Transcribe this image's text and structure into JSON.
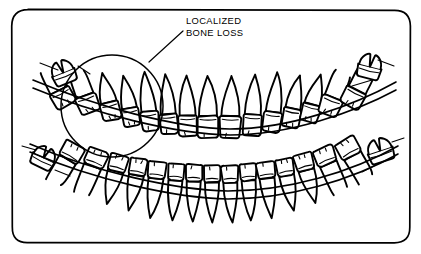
{
  "figure": {
    "background_color": "#ffffff",
    "ink_color": "#000000"
  },
  "annotation": {
    "label_line_1": "LOCALIZED",
    "label_line_2": "BONE LOSS",
    "label_x": 186,
    "label_y_line1": 24,
    "label_y_line2": 36,
    "leader_from_x": 183,
    "leader_from_y": 31,
    "leader_to_x": 149,
    "leader_to_y": 62,
    "circle_cx": 112,
    "circle_cy": 106,
    "circle_r": 51
  },
  "frame": {
    "x": 12,
    "y": 10,
    "width": 398,
    "height": 233,
    "corner_radius": 16
  },
  "chart_data": {
    "type": "diagram",
    "annotations": [
      {
        "text": "LOCALIZED BONE LOSS",
        "target": "upper-left-posterior-region",
        "marker": "circle"
      }
    ],
    "arches": [
      {
        "name": "upper-arch",
        "root_direction": "up",
        "tooth_count": 16,
        "bone_level": "receded in left posterior segment"
      },
      {
        "name": "lower-arch",
        "root_direction": "down",
        "tooth_count": 16,
        "bone_level": "normal"
      }
    ]
  },
  "upper_arch": {
    "name": "upper-arch",
    "teeth": [
      {
        "id": "u1",
        "type": "molar",
        "crown_x": 63,
        "crown_y": 98,
        "crown_w": 22,
        "crown_h": 17,
        "root_len": 24,
        "root_dir": -1,
        "tilt": -28
      },
      {
        "id": "u2",
        "type": "molar",
        "crown_x": 88,
        "crown_y": 104,
        "crown_w": 21,
        "crown_h": 18,
        "root_len": 26,
        "root_dir": -1,
        "tilt": -20
      },
      {
        "id": "u3",
        "type": "premolar",
        "crown_x": 111,
        "crown_y": 111,
        "crown_w": 19,
        "crown_h": 18,
        "root_len": 30,
        "root_dir": -1,
        "tilt": -14
      },
      {
        "id": "u4",
        "type": "premolar",
        "crown_x": 131,
        "crown_y": 117,
        "crown_w": 18,
        "crown_h": 18,
        "root_len": 33,
        "root_dir": -1,
        "tilt": -10
      },
      {
        "id": "u5",
        "type": "canine",
        "crown_x": 150,
        "crown_y": 121,
        "crown_w": 18,
        "crown_h": 19,
        "root_len": 40,
        "root_dir": -1,
        "tilt": -7
      },
      {
        "id": "u6",
        "type": "incisor",
        "crown_x": 169,
        "crown_y": 124,
        "crown_w": 18,
        "crown_h": 20,
        "root_len": 40,
        "root_dir": -1,
        "tilt": -4
      },
      {
        "id": "u7",
        "type": "incisor",
        "crown_x": 188,
        "crown_y": 126,
        "crown_w": 19,
        "crown_h": 21,
        "root_len": 40,
        "root_dir": -1,
        "tilt": -2
      },
      {
        "id": "u8",
        "type": "incisor",
        "crown_x": 208,
        "crown_y": 127,
        "crown_w": 21,
        "crown_h": 22,
        "root_len": 40,
        "root_dir": -1,
        "tilt": 0
      },
      {
        "id": "u9",
        "type": "incisor",
        "crown_x": 230,
        "crown_y": 127,
        "crown_w": 21,
        "crown_h": 22,
        "root_len": 40,
        "root_dir": -1,
        "tilt": 2
      },
      {
        "id": "u10",
        "type": "incisor",
        "crown_x": 252,
        "crown_y": 125,
        "crown_w": 19,
        "crown_h": 21,
        "root_len": 40,
        "root_dir": -1,
        "tilt": 4
      },
      {
        "id": "u11",
        "type": "canine",
        "crown_x": 272,
        "crown_y": 122,
        "crown_w": 18,
        "crown_h": 20,
        "root_len": 40,
        "root_dir": -1,
        "tilt": 7
      },
      {
        "id": "u12",
        "type": "premolar",
        "crown_x": 291,
        "crown_y": 118,
        "crown_w": 18,
        "crown_h": 19,
        "root_len": 34,
        "root_dir": -1,
        "tilt": 11
      },
      {
        "id": "u13",
        "type": "premolar",
        "crown_x": 310,
        "crown_y": 113,
        "crown_w": 19,
        "crown_h": 18,
        "root_len": 31,
        "root_dir": -1,
        "tilt": 15
      },
      {
        "id": "u14",
        "type": "molar",
        "crown_x": 330,
        "crown_y": 106,
        "crown_w": 21,
        "crown_h": 18,
        "root_len": 27,
        "root_dir": -1,
        "tilt": 21
      },
      {
        "id": "u15",
        "type": "molar",
        "crown_x": 353,
        "crown_y": 98,
        "crown_w": 22,
        "crown_h": 18,
        "root_len": 25,
        "root_dir": -1,
        "tilt": 27
      }
    ]
  },
  "lower_arch": {
    "name": "lower-arch",
    "teeth": [
      {
        "id": "l1",
        "type": "molar",
        "crown_x": 72,
        "crown_y": 152,
        "crown_w": 22,
        "crown_h": 17,
        "root_len": 28,
        "root_dir": 1,
        "tilt": 30
      },
      {
        "id": "l2",
        "type": "molar",
        "crown_x": 96,
        "crown_y": 158,
        "crown_w": 21,
        "crown_h": 17,
        "root_len": 31,
        "root_dir": 1,
        "tilt": 22
      },
      {
        "id": "l3",
        "type": "premolar",
        "crown_x": 118,
        "crown_y": 163,
        "crown_w": 19,
        "crown_h": 17,
        "root_len": 34,
        "root_dir": 1,
        "tilt": 16
      },
      {
        "id": "l4",
        "type": "premolar",
        "crown_x": 138,
        "crown_y": 167,
        "crown_w": 18,
        "crown_h": 17,
        "root_len": 36,
        "root_dir": 1,
        "tilt": 11
      },
      {
        "id": "l5",
        "type": "canine",
        "crown_x": 157,
        "crown_y": 170,
        "crown_w": 18,
        "crown_h": 17,
        "root_len": 40,
        "root_dir": 1,
        "tilt": 7
      },
      {
        "id": "l6",
        "type": "incisor",
        "crown_x": 176,
        "crown_y": 172,
        "crown_w": 17,
        "crown_h": 17,
        "root_len": 40,
        "root_dir": 1,
        "tilt": 4
      },
      {
        "id": "l7",
        "type": "incisor",
        "crown_x": 194,
        "crown_y": 173,
        "crown_w": 17,
        "crown_h": 17,
        "root_len": 40,
        "root_dir": 1,
        "tilt": 2
      },
      {
        "id": "l8",
        "type": "incisor",
        "crown_x": 212,
        "crown_y": 174,
        "crown_w": 17,
        "crown_h": 17,
        "root_len": 40,
        "root_dir": 1,
        "tilt": 0
      },
      {
        "id": "l9",
        "type": "incisor",
        "crown_x": 230,
        "crown_y": 174,
        "crown_w": 17,
        "crown_h": 17,
        "root_len": 40,
        "root_dir": 1,
        "tilt": -2
      },
      {
        "id": "l10",
        "type": "incisor",
        "crown_x": 248,
        "crown_y": 172,
        "crown_w": 17,
        "crown_h": 17,
        "root_len": 40,
        "root_dir": 1,
        "tilt": -4
      },
      {
        "id": "l11",
        "type": "canine",
        "crown_x": 266,
        "crown_y": 170,
        "crown_w": 18,
        "crown_h": 17,
        "root_len": 40,
        "root_dir": 1,
        "tilt": -7
      },
      {
        "id": "l12",
        "type": "premolar",
        "crown_x": 285,
        "crown_y": 167,
        "crown_w": 18,
        "crown_h": 17,
        "root_len": 36,
        "root_dir": 1,
        "tilt": -11
      },
      {
        "id": "l13",
        "type": "premolar",
        "crown_x": 304,
        "crown_y": 162,
        "crown_w": 19,
        "crown_h": 17,
        "root_len": 34,
        "root_dir": 1,
        "tilt": -16
      },
      {
        "id": "l14",
        "type": "molar",
        "crown_x": 325,
        "crown_y": 156,
        "crown_w": 21,
        "crown_h": 17,
        "root_len": 31,
        "root_dir": 1,
        "tilt": -23
      },
      {
        "id": "l15",
        "type": "molar",
        "crown_x": 348,
        "crown_y": 148,
        "crown_w": 22,
        "crown_h": 18,
        "root_len": 28,
        "root_dir": 1,
        "tilt": -30
      }
    ]
  },
  "detached_teeth": [
    {
      "id": "ul-wisdom",
      "name": "upper-left-third-molar",
      "cx": 63,
      "cy": 72,
      "w": 24,
      "h": 24,
      "tilt": -22
    },
    {
      "id": "ur-wisdom",
      "name": "upper-right-third-molar",
      "cx": 370,
      "cy": 66,
      "w": 24,
      "h": 25,
      "tilt": 14
    },
    {
      "id": "ll-wisdom",
      "name": "lower-left-third-molar",
      "cx": 44,
      "cy": 157,
      "w": 24,
      "h": 22,
      "tilt": 26
    },
    {
      "id": "lr-wisdom",
      "name": "lower-right-third-molar",
      "cx": 380,
      "cy": 150,
      "w": 26,
      "h": 24,
      "tilt": -18
    }
  ],
  "bone_lines": {
    "upper_outer": "M 33,80 C 95,106 175,128 230,129 C 290,129 355,105 396,82",
    "upper_inner": "M 33,88 C 95,114 175,134 230,135 C 290,135 355,112 396,90",
    "lower_outer": "M 30,144 C 95,172 175,190 228,191 C 288,191 352,172 398,146",
    "lower_inner": "M 30,152 C 95,180 175,198 228,199 C 288,199 352,180 398,154"
  }
}
